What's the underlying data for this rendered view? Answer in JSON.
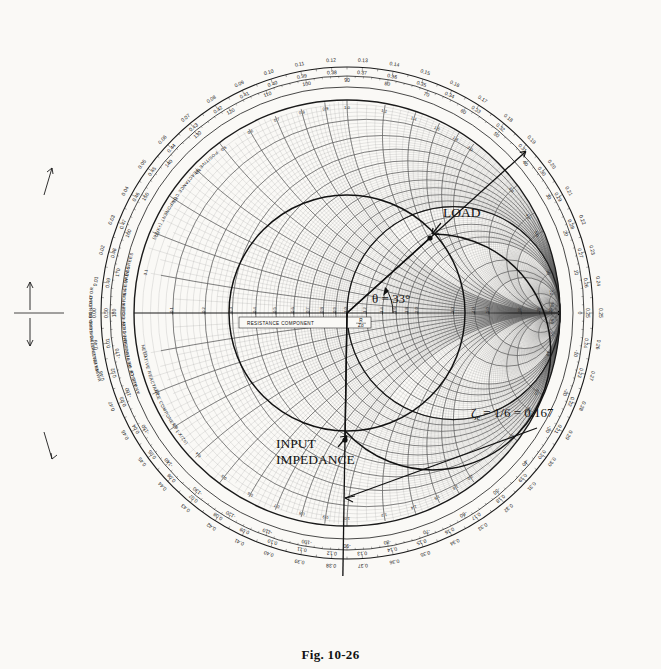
{
  "figure": {
    "caption": "Fig. 10-26"
  },
  "annotations": {
    "load": "LOAD",
    "input_impedance_l1": "INPUT",
    "input_impedance_l2": "IMPEDANCE",
    "theta": "θ = 33°",
    "zeta": "ζ",
    "zeta_sub": "e",
    "zeta_eq": " = 1/6 = 0.167"
  },
  "axis_labels": {
    "resistance": "RESISTANCE COMPONENT",
    "resistance_sub_num": "R",
    "resistance_sub_den": "Zo",
    "positive_reactance": "POSITIVE REACTANCE COMPONENT (+X/Zo)",
    "negative_reactance": "NEGATIVE REACTANCE COMPONENT (-X/Zo)",
    "wavelengths_generator": "WAVELENGTHS TOWARD GENERATOR",
    "wavelengths_load": "WAVELENGTHS TOWARD LOAD",
    "angle_refl": "ANGLE OF REFLECTION COEFFICIENT IN DEGREES",
    "angle_trans": "ANGLE OF TRANSMISSION COEFFICIENT IN DEGREES"
  },
  "colors": {
    "ink": "#1a1a1a",
    "grid": "#5a5a5a",
    "grid_light": "#8d8d8d",
    "paper": "#faf9f6",
    "accent": "#111111"
  },
  "chart_data": {
    "type": "smith",
    "title": "Fig. 10-26",
    "xlabel": "RESISTANCE COMPONENT (R/Zo)",
    "ylabel": "REACTANCE COMPONENT (X/Zo)",
    "grid": true,
    "legend": "none",
    "normalized_center": 1.0,
    "resistance_circles": [
      0.1,
      0.2,
      0.3,
      0.4,
      0.5,
      0.6,
      0.7,
      0.8,
      0.9,
      1.0,
      1.2,
      1.4,
      1.6,
      1.8,
      2.0,
      3.0,
      4.0,
      5.0,
      10.0,
      20.0,
      50.0
    ],
    "resistance_axis_ticks": [
      "0.1",
      "0.2",
      "0.3",
      "0.4",
      "0.5",
      "0.6",
      "0.7",
      "0.8",
      "0.9",
      "1.0",
      "1.2",
      "1.4",
      "1.6",
      "1.8",
      "2.0",
      "3.0",
      "4.0",
      "5.0",
      "10",
      "20",
      "50"
    ],
    "reactance_arcs": [
      0.1,
      0.2,
      0.3,
      0.4,
      0.5,
      0.6,
      0.7,
      0.8,
      0.9,
      1.0,
      1.2,
      1.4,
      1.6,
      1.8,
      2.0,
      3.0,
      4.0,
      5.0,
      10.0,
      20.0,
      50.0
    ],
    "reactance_arc_labels": [
      "0.1",
      "0.2",
      "0.3",
      "0.4",
      "0.5",
      "0.6",
      "0.7",
      "0.8",
      "0.9",
      "1.0",
      "1.2",
      "1.4",
      "1.6",
      "1.8",
      "2.0",
      "3.0",
      "4.0",
      "5.0",
      "10",
      "20",
      "50"
    ],
    "outer_scale_wavelengths_toward_generator": [
      "0.00",
      "0.01",
      "0.02",
      "0.03",
      "0.04",
      "0.05",
      "0.06",
      "0.07",
      "0.08",
      "0.09",
      "0.10",
      "0.11",
      "0.12",
      "0.13",
      "0.14",
      "0.15",
      "0.16",
      "0.17",
      "0.18",
      "0.19",
      "0.20",
      "0.21",
      "0.22",
      "0.23",
      "0.24",
      "0.25",
      "0.26",
      "0.27",
      "0.28",
      "0.29",
      "0.30",
      "0.31",
      "0.32",
      "0.33",
      "0.34",
      "0.35",
      "0.36",
      "0.37",
      "0.38",
      "0.39",
      "0.40",
      "0.41",
      "0.42",
      "0.43",
      "0.44",
      "0.45",
      "0.46",
      "0.47",
      "0.48",
      "0.49"
    ],
    "outer_scale_wavelengths_toward_load": [
      "0.50",
      "0.49",
      "0.48",
      "0.47",
      "0.46",
      "0.45",
      "0.44",
      "0.43",
      "0.42",
      "0.41",
      "0.40",
      "0.39",
      "0.38",
      "0.37",
      "0.36",
      "0.35",
      "0.34",
      "0.33",
      "0.32",
      "0.31",
      "0.30",
      "0.29",
      "0.28",
      "0.27",
      "0.26",
      "0.25"
    ],
    "angle_scale_degrees": [
      0,
      10,
      20,
      30,
      40,
      50,
      60,
      70,
      80,
      90,
      100,
      110,
      120,
      130,
      140,
      150,
      160,
      170,
      180,
      -170,
      -160,
      -150,
      -140,
      -130,
      -120,
      -110,
      -100,
      -90,
      -80,
      -70,
      -60,
      -50,
      -40,
      -30,
      -20,
      -10
    ],
    "points": [
      {
        "name": "LOAD",
        "r": 1.0,
        "x": 1.1,
        "gamma_mag": 0.48,
        "gamma_angle_deg": 33,
        "plot": [
          430,
          238
        ]
      },
      {
        "name": "INPUT IMPEDANCE",
        "r": 0.35,
        "x": -0.6,
        "gamma_mag": 0.48,
        "gamma_angle_deg": -108,
        "plot": [
          345,
          440
        ]
      }
    ],
    "swr_circle": {
      "gamma_mag": 0.48,
      "center": [
        347,
        313
      ],
      "radius_px": 118
    },
    "radial_lines": [
      {
        "from_center_to_angle_deg": 33,
        "label": "LOAD radius"
      },
      {
        "from_center_to_angle_deg": -108,
        "label": "INPUT IMPEDANCE radius"
      }
    ],
    "annotations": [
      {
        "text": "θ = 33°",
        "at": [
          368,
          308
        ]
      },
      {
        "text": "ζe = 1/6 = 0.167",
        "at": [
          474,
          412
        ]
      },
      {
        "text": "LOAD",
        "at": [
          443,
          212
        ]
      },
      {
        "text": "INPUT IMPEDANCE",
        "at": [
          276,
          452
        ]
      }
    ]
  }
}
